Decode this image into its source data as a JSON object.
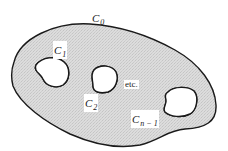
{
  "diagram": {
    "type": "multiply-connected-region",
    "colors": {
      "region_fill": "#d9d9d9",
      "contour_stroke": "#1a1a1a",
      "hole_fill": "#ffffff",
      "background": "#ffffff"
    },
    "outer_contour": {
      "label_main": "C",
      "label_sub": "0"
    },
    "holes": [
      {
        "label_main": "C",
        "label_sub": "1"
      },
      {
        "label_main": "C",
        "label_sub": "2"
      },
      {
        "label_main": "C",
        "label_sub": "n − 1"
      }
    ],
    "ellipsis_text": "etc."
  }
}
